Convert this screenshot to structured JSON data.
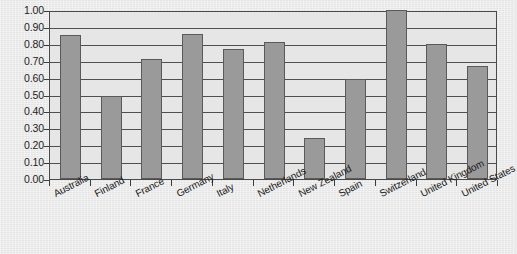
{
  "chart_data": {
    "type": "bar",
    "title": "",
    "subtitle": "",
    "xlabel": "",
    "ylabel": "",
    "ylim": [
      0,
      1.0
    ],
    "grid": true,
    "legend": false,
    "legend_position": "none",
    "orientation": "vertical",
    "bar_color": "#9a9a9a",
    "bar_edge_color": "#5a5a5a",
    "plot_background": "#e6e6e6",
    "axis_color": "#4a4a4a",
    "categories": [
      "Australia",
      "Finland",
      "France",
      "Germany",
      "Italy",
      "Netherlands",
      "New Zealand",
      "Spain",
      "Switzerland",
      "United Kingdom",
      "United States"
    ],
    "values": [
      0.85,
      0.49,
      0.71,
      0.86,
      0.77,
      0.81,
      0.24,
      0.59,
      1.0,
      0.8,
      0.67
    ],
    "ytick_labels": [
      "1.00",
      "0.90",
      "0.80",
      "0.70",
      "0.60",
      "0.50",
      "0.40",
      "0.30",
      "0.20",
      "0.10",
      "0.00"
    ],
    "ytick_values": [
      1.0,
      0.9,
      0.8,
      0.7,
      0.6,
      0.5,
      0.4,
      0.3,
      0.2,
      0.1,
      0.0
    ]
  }
}
